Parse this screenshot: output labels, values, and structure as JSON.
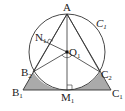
{
  "diagram": {
    "colors": {
      "stroke": "#333333",
      "shade": "#aaaaaa",
      "background": "#ffffff"
    },
    "labels": {
      "A": "A",
      "N": "N",
      "N_sub": "1",
      "O": "O",
      "O_sub": "1",
      "circle": "C",
      "circle_sub": "1",
      "B2": "B",
      "B2_sub": "2",
      "C2": "C",
      "C2_sub": "2",
      "B1": "B",
      "B1_sub": "1",
      "C1": "C",
      "C1_sub": "1",
      "M": "M",
      "M_sub": "1"
    },
    "points": {
      "A": [
        67,
        14
      ],
      "O1": [
        67,
        52
      ],
      "M1": [
        67,
        90
      ],
      "B1": [
        23,
        90
      ],
      "C1": [
        111,
        90
      ],
      "B2": [
        33,
        72
      ],
      "C2": [
        100,
        72
      ],
      "N1": [
        50,
        43
      ]
    },
    "circle": {
      "cx": 67,
      "cy": 52,
      "r": 38
    }
  }
}
